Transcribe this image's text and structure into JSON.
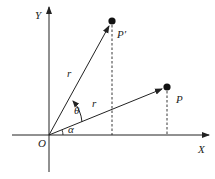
{
  "diagram": {
    "labels": {
      "y_axis": "Y",
      "x_axis": "X",
      "origin": "O",
      "point_p": "P",
      "point_p_prime": "P′",
      "radius_upper": "r",
      "radius_lower": "r",
      "theta": "θ",
      "alpha": "α"
    },
    "colors": {
      "stroke": "#222222",
      "background": "#ffffff"
    },
    "geometry": {
      "origin": [
        49,
        135
      ],
      "p": [
        167,
        87
      ],
      "p_prime": [
        112,
        21
      ],
      "x_axis_range": [
        12,
        210
      ],
      "y_axis_range": [
        172,
        6
      ]
    }
  }
}
